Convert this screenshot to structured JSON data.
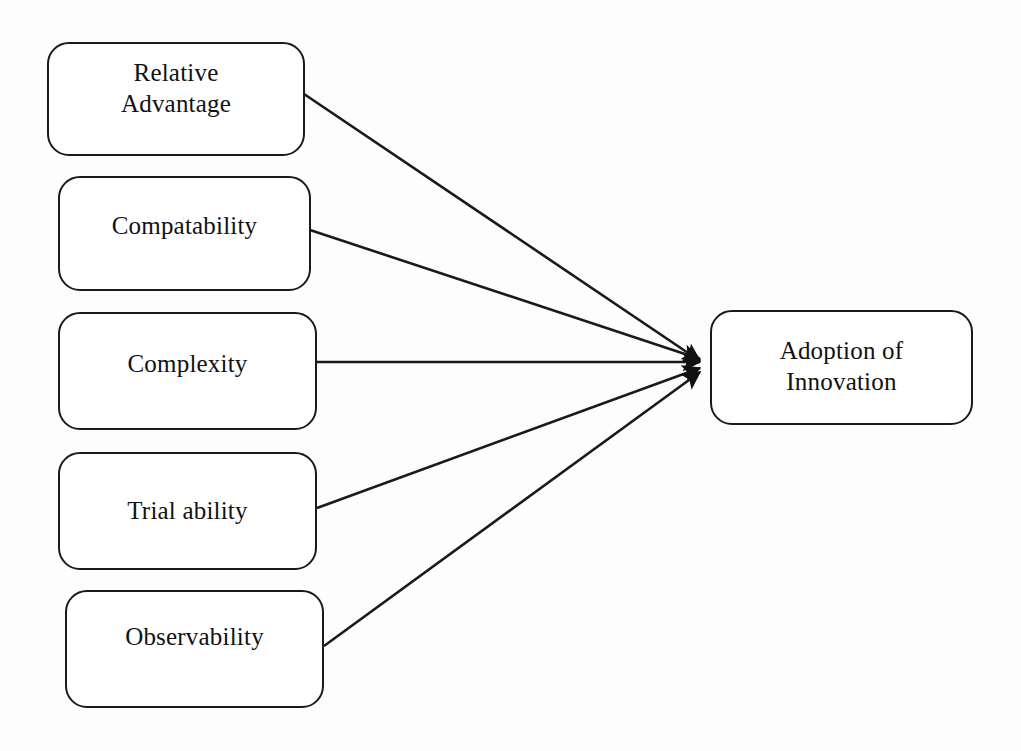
{
  "diagram": {
    "type": "conceptual-model",
    "stroke_color": "#1a1a1a",
    "background_color": "#fdfdfd",
    "text_color": "#111111",
    "antecedents": [
      {
        "id": "relative-advantage",
        "label": "Relative\nAdvantage",
        "box": {
          "x": 47,
          "y": 42,
          "w": 258,
          "h": 114
        },
        "text_pad": "pad-t-14",
        "edge_from": {
          "x": 304,
          "y": 94
        }
      },
      {
        "id": "compatability",
        "label": "Compatability",
        "box": {
          "x": 58,
          "y": 176,
          "w": 253,
          "h": 115
        },
        "text_pad": "pad-t-33",
        "edge_from": {
          "x": 310,
          "y": 230
        }
      },
      {
        "id": "complexity",
        "label": "Complexity",
        "box": {
          "x": 58,
          "y": 312,
          "w": 259,
          "h": 118
        },
        "text_pad": "pad-t-35",
        "edge_from": {
          "x": 317,
          "y": 362
        }
      },
      {
        "id": "trial-ability",
        "label": "Trial ability",
        "box": {
          "x": 58,
          "y": 452,
          "w": 259,
          "h": 118
        },
        "text_pad": "pad-t-42",
        "edge_from": {
          "x": 317,
          "y": 508
        }
      },
      {
        "id": "observability",
        "label": "Observability",
        "box": {
          "x": 65,
          "y": 590,
          "w": 259,
          "h": 118
        },
        "text_pad": "pad-t-30",
        "edge_from": {
          "x": 324,
          "y": 646
        }
      }
    ],
    "outcome": {
      "id": "adoption-of-innovation",
      "label": "Adoption of\nInnovation",
      "box": {
        "x": 710,
        "y": 310,
        "w": 263,
        "h": 115
      },
      "text_pad": "pad-t-24"
    },
    "convergence_point": {
      "x": 702,
      "y": 363
    },
    "edge_count": 5,
    "arrowhead": "filled-triangle"
  }
}
